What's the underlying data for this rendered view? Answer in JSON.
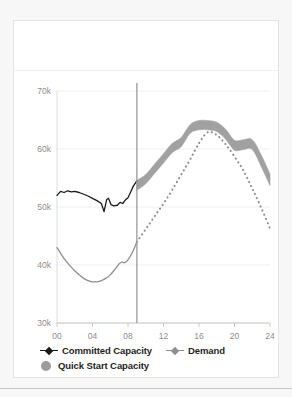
{
  "panel": {
    "header_title": ""
  },
  "legend": {
    "rows": [
      [
        {
          "name": "committed-capacity",
          "label": "Committed Capacity",
          "marker": "line-diamond",
          "color": "#1a1a1a"
        },
        {
          "name": "demand",
          "label": "Demand",
          "marker": "line-diamond",
          "color": "#8e8e8e"
        }
      ],
      [
        {
          "name": "quick-start-capacity",
          "label": "Quick Start Capacity",
          "marker": "circle",
          "color": "#9d9d9d"
        }
      ]
    ],
    "committed_label": "Committed Capacity",
    "demand_label": "Demand",
    "quick_start_label": "Quick Start Capacity"
  },
  "chart_data": {
    "type": "line",
    "title": "",
    "subtitle": "",
    "xlabel": "",
    "ylabel": "",
    "xlim": [
      0,
      24
    ],
    "ylim": [
      30000,
      70000
    ],
    "grid": true,
    "legend_position": "bottom-left",
    "x_ticks": [
      "00",
      "04",
      "08",
      "12",
      "16",
      "20",
      "24"
    ],
    "x_tick_values": [
      0,
      4,
      8,
      12,
      16,
      20,
      24
    ],
    "y_ticks": [
      "30k",
      "40k",
      "50k",
      "60k",
      "70k"
    ],
    "y_tick_values": [
      30000,
      40000,
      50000,
      60000,
      70000
    ],
    "now_marker": {
      "x": 9,
      "label": "",
      "color": "#9a9a9a"
    },
    "series": [
      {
        "name": "Committed Capacity",
        "type": "line",
        "style": "solid",
        "color": "#1a1a1a",
        "x": [
          0,
          0.4,
          0.8,
          1.2,
          1.6,
          2.0,
          2.5,
          3.0,
          3.5,
          4.0,
          4.5,
          5.0,
          5.3,
          5.6,
          5.8,
          6.1,
          6.4,
          6.8,
          7.1,
          7.4,
          7.7,
          8.0,
          8.3,
          8.6,
          9.0
        ],
        "values": [
          52000,
          52700,
          52500,
          52800,
          52600,
          52700,
          52500,
          52200,
          51900,
          51500,
          51100,
          50600,
          49200,
          51300,
          51500,
          50400,
          50200,
          50300,
          50800,
          50600,
          51200,
          51600,
          52600,
          53600,
          54500
        ]
      },
      {
        "name": "Demand",
        "type": "line",
        "style": "solid",
        "color": "#8e8e8e",
        "segment": "actual",
        "x": [
          0,
          0.5,
          1.0,
          1.5,
          2.0,
          2.5,
          3.0,
          3.5,
          4.0,
          4.5,
          5.0,
          5.5,
          6.0,
          6.5,
          7.0,
          7.3,
          7.6,
          8.0,
          8.5,
          9.0
        ],
        "values": [
          43000,
          41800,
          40700,
          39800,
          39000,
          38300,
          37700,
          37300,
          37100,
          37100,
          37300,
          37700,
          38300,
          39200,
          40200,
          40500,
          40400,
          40900,
          42200,
          44000
        ]
      },
      {
        "name": "Demand",
        "type": "line",
        "style": "dotted",
        "color": "#8e8e8e",
        "segment": "forecast",
        "x": [
          9,
          10,
          11,
          12,
          13,
          14,
          15,
          16,
          17,
          18,
          19,
          20,
          21,
          22,
          23,
          24
        ],
        "values": [
          44000,
          46200,
          48400,
          50600,
          53000,
          55600,
          58200,
          61000,
          62900,
          62400,
          60800,
          58700,
          56300,
          53200,
          49900,
          46300
        ]
      },
      {
        "name": "Quick Start Capacity",
        "type": "band",
        "color": "#9d9d9d",
        "x": [
          9,
          10,
          11,
          12,
          13,
          14,
          15,
          16,
          17,
          18,
          19,
          20,
          21,
          22,
          23,
          24
        ],
        "upper": [
          54600,
          55600,
          57400,
          59200,
          61000,
          62000,
          64200,
          64900,
          64900,
          64600,
          63400,
          61500,
          61600,
          61600,
          59000,
          55700
        ],
        "lower": [
          52900,
          54000,
          55800,
          57600,
          59400,
          60400,
          62700,
          63300,
          63300,
          63000,
          61700,
          59800,
          59900,
          59900,
          57000,
          53700
        ]
      }
    ]
  }
}
